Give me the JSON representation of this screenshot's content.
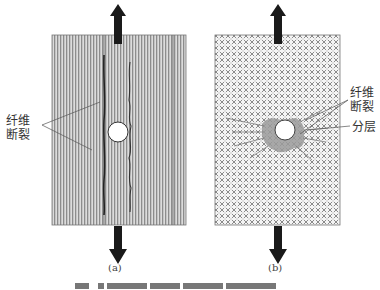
{
  "figure": {
    "panel_a": {
      "label": "(a)",
      "annotation": [
        "纤维",
        "断裂"
      ],
      "pattern": "vertical-fiber-stripes"
    },
    "panel_b": {
      "label": "(b)",
      "annotations": [
        {
          "lines": [
            "纤维",
            "断裂"
          ]
        },
        {
          "lines": [
            "分层"
          ]
        }
      ],
      "pattern": "crosshatch-woven"
    },
    "colors": {
      "stripe_dark": "#8a8a8a",
      "stripe_light": "#d8d8d8",
      "arrow": "#1a1a1a",
      "damage_gray": "#9a9a9a"
    },
    "caption_visible": false
  }
}
